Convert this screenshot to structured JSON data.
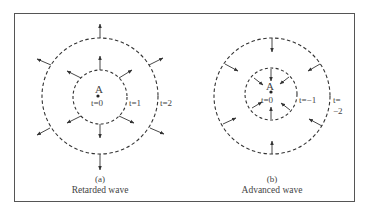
{
  "figure": {
    "panel_a": {
      "point_label": "A",
      "inner_label": "t=0",
      "middle_label": "t=1",
      "outer_label": "t=2",
      "tag": "(a)",
      "caption": "Retarded wave",
      "arrow_direction": "outward"
    },
    "panel_b": {
      "point_label": "A",
      "inner_label": "t=0",
      "middle_label": "t=−1",
      "outer_label_top": "t=",
      "outer_label_bottom": "−2",
      "tag": "(b)",
      "caption": "Advanced wave",
      "arrow_direction": "inward"
    }
  }
}
